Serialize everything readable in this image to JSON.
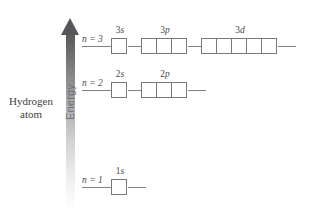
{
  "diagram": {
    "title_line1": "Hydrogen",
    "title_line2": "atom",
    "axis_label": "Energy",
    "axis_direction": "up",
    "arrow_gradient_top": "#55555a",
    "arrow_gradient_bottom": "#fdfdfd",
    "line_color": "#808085",
    "box_border_color": "#77777c"
  },
  "levels": [
    {
      "id": "n3",
      "n_label": "n = 3",
      "n_value": 3,
      "y": 46,
      "orbitals": [
        {
          "label": "3s",
          "label_n": "3",
          "label_letter": "s",
          "boxes": 1
        },
        {
          "label": "3p",
          "label_n": "3",
          "label_letter": "p",
          "boxes": 3
        },
        {
          "label": "3d",
          "label_n": "3",
          "label_letter": "d",
          "boxes": 5
        }
      ]
    },
    {
      "id": "n2",
      "n_label": "n = 2",
      "n_value": 2,
      "y": 90,
      "orbitals": [
        {
          "label": "2s",
          "label_n": "2",
          "label_letter": "s",
          "boxes": 1
        },
        {
          "label": "2p",
          "label_n": "2",
          "label_letter": "p",
          "boxes": 3
        }
      ]
    },
    {
      "id": "n1",
      "n_label": "n = 1",
      "n_value": 1,
      "y": 187,
      "orbitals": [
        {
          "label": "1s",
          "label_n": "1",
          "label_letter": "s",
          "boxes": 1
        }
      ]
    }
  ]
}
